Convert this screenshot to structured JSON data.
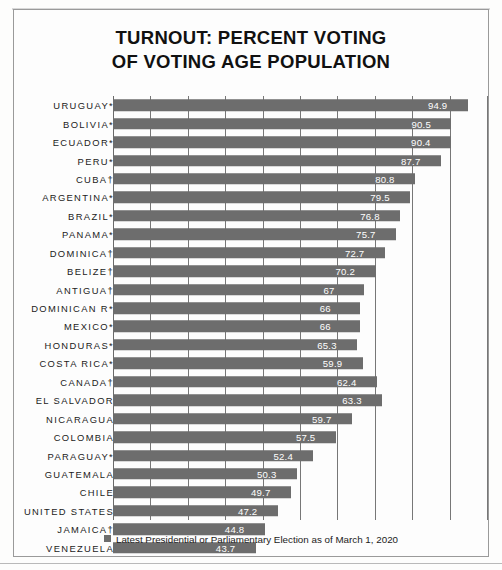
{
  "chart_data": {
    "type": "bar",
    "orientation": "horizontal",
    "title": "TURNOUT: PERCENT VOTING OF VOTING AGE POPULATION",
    "title_lines": [
      "TURNOUT: PERCENT VOTING",
      "OF VOTING AGE POPULATION"
    ],
    "xlabel": "",
    "ylabel": "",
    "xlim": [
      0,
      100
    ],
    "grid": true,
    "gridlines": [
      0,
      10,
      20,
      30,
      40,
      50,
      60,
      70,
      80,
      90,
      100
    ],
    "legend_position": "bottom",
    "bar_color": "#6d6d6d",
    "value_label_color": "#ffffff",
    "legend": [
      {
        "label": "Latest Presidential or Parliamentary Election as of March 1, 2020",
        "color": "#6d6d6d"
      }
    ],
    "categories": [
      "URUGUAY*",
      "BOLIVIA*",
      "ECUADOR*",
      "PERU*",
      "CUBA†",
      "ARGENTINA*",
      "BRAZIL*",
      "PANAMA*",
      "DOMINICA†",
      "BELIZE†",
      "ANTIGUA†",
      "DOMINICAN R*",
      "MEXICO*",
      "HONDURAS*",
      "COSTA RICA*",
      "CANADA†",
      "EL SALVADOR",
      "NICARAGUA",
      "COLOMBIA",
      "PARAGUAY*",
      "GUATEMALA",
      "CHILE",
      "UNITED STATES",
      "JAMAICA†",
      "VENEZUELA"
    ],
    "values": [
      94.9,
      90.5,
      90.4,
      87.7,
      80.8,
      79.5,
      76.8,
      75.7,
      72.7,
      70.2,
      67,
      66,
      66,
      65.3,
      59.9,
      62.4,
      63.3,
      59.7,
      57.5,
      52.4,
      50.3,
      49.7,
      47.2,
      44.8,
      43.7
    ],
    "value_labels": [
      "94.9",
      "90.5",
      "90.4",
      "87.7",
      "80.8",
      "79.5",
      "76.8",
      "75.7",
      "72.7",
      "70.2",
      "67",
      "66",
      "66",
      "65.3",
      "59.9",
      "62.4",
      "63.3",
      "59.7",
      "57.5",
      "52.4",
      "50.3",
      "49.7",
      "47.2",
      "44.8",
      "43.7"
    ],
    "bar_lengths_pct": [
      94.9,
      90.5,
      90.4,
      87.7,
      80.8,
      79.5,
      76.8,
      75.7,
      72.7,
      70.2,
      67,
      66,
      66,
      65.3,
      66.8,
      70.6,
      72.0,
      63.9,
      59.6,
      53.6,
      49.2,
      47.6,
      44.1,
      40.6,
      38.2
    ],
    "notes": {
      "asterisk": "*",
      "dagger": "†"
    }
  }
}
